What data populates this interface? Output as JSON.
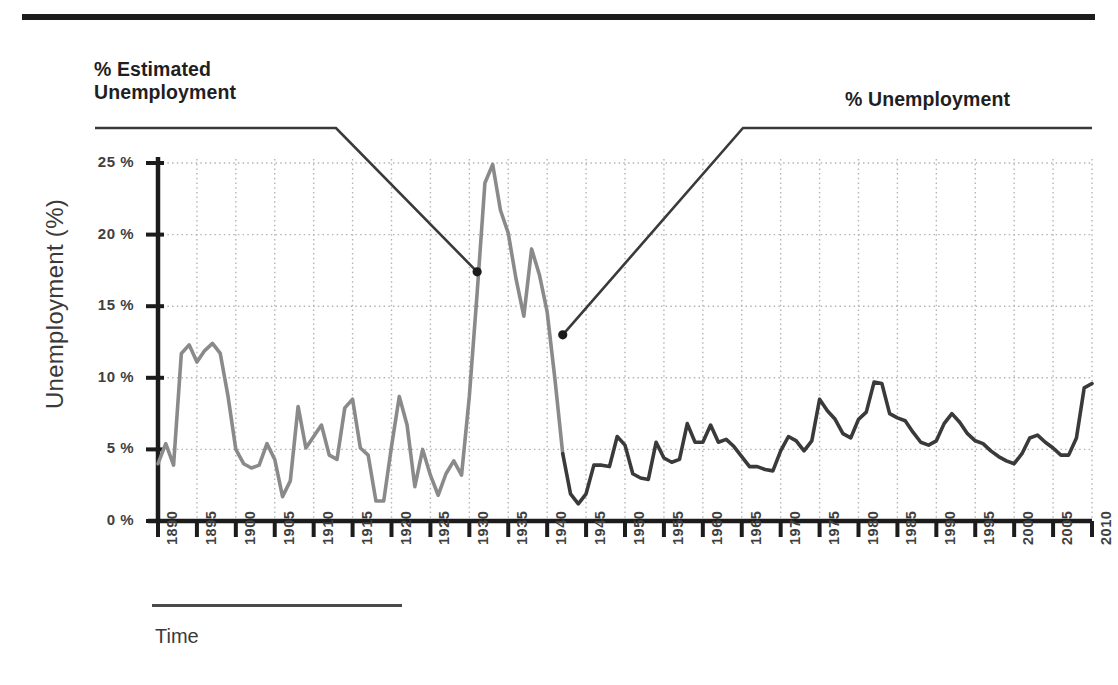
{
  "figure": {
    "top_rule": true,
    "callouts": [
      {
        "id": "estimated",
        "text": "% Estimated\nUnemployment",
        "color": "#1f1f1f"
      },
      {
        "id": "actual",
        "text": "% Unemployment",
        "color": "#1f1f1f"
      }
    ],
    "x_axis_caption": "Time"
  },
  "colors": {
    "estimated_series": "#8a8a8a",
    "actual_series": "#3a3a3a",
    "axis": "#1c1c1c",
    "grid": "#b4b4b4",
    "leader": "#3a3a3a",
    "rule": "#4a4a4a"
  },
  "chart_data": {
    "type": "line",
    "title": "",
    "subtitle": "",
    "xlabel": "Time",
    "ylabel": "Unemployment (%)",
    "xlim": [
      1890,
      2010
    ],
    "ylim": [
      0,
      25
    ],
    "grid": true,
    "legend_position": "callout-labels",
    "y_ticks": [
      0,
      5,
      10,
      15,
      20,
      25
    ],
    "y_tick_labels": [
      "0 %",
      "5 %",
      "10 %",
      "15 %",
      "20 %",
      "25 %"
    ],
    "x_ticks": [
      1890,
      1895,
      1900,
      1905,
      1910,
      1915,
      1920,
      1925,
      1930,
      1935,
      1940,
      1945,
      1950,
      1955,
      1960,
      1965,
      1970,
      1975,
      1980,
      1985,
      1990,
      1995,
      2000,
      2005,
      2010
    ],
    "x_tick_labels": [
      "1890",
      "1895",
      "1900",
      "1905",
      "1910",
      "1915",
      "1920",
      "1925",
      "1930",
      "1935",
      "1940",
      "1945",
      "1950",
      "1955",
      "1960",
      "1965",
      "1970",
      "1975",
      "1980",
      "1985",
      "1990",
      "1995",
      "2000",
      "2005",
      "2010"
    ],
    "annotations": [
      {
        "label": "% Estimated Unemployment",
        "points_to_year": 1931,
        "points_to_value": 17.4
      },
      {
        "label": "% Unemployment",
        "points_to_year": 1942,
        "points_to_value": 13.0
      }
    ],
    "series": [
      {
        "name": "% Estimated Unemployment",
        "color": "#8a8a8a",
        "x": [
          1890,
          1891,
          1892,
          1893,
          1894,
          1895,
          1896,
          1897,
          1898,
          1899,
          1900,
          1901,
          1902,
          1903,
          1904,
          1905,
          1906,
          1907,
          1908,
          1909,
          1910,
          1911,
          1912,
          1913,
          1914,
          1915,
          1916,
          1917,
          1918,
          1919,
          1920,
          1921,
          1922,
          1923,
          1924,
          1925,
          1926,
          1927,
          1928,
          1929,
          1930,
          1931,
          1932,
          1933,
          1934,
          1935,
          1936,
          1937,
          1938,
          1939,
          1940,
          1941,
          1942
        ],
        "values": [
          4.0,
          5.4,
          3.9,
          11.7,
          12.3,
          11.1,
          11.9,
          12.4,
          11.7,
          8.7,
          5.0,
          4.0,
          3.7,
          3.9,
          5.4,
          4.3,
          1.7,
          2.8,
          8.0,
          5.1,
          5.9,
          6.7,
          4.6,
          4.3,
          7.9,
          8.5,
          5.1,
          4.6,
          1.4,
          1.4,
          5.2,
          8.7,
          6.7,
          2.4,
          5.0,
          3.2,
          1.8,
          3.3,
          4.2,
          3.2,
          8.7,
          15.9,
          23.6,
          24.9,
          21.7,
          20.1,
          16.9,
          14.3,
          19.0,
          17.2,
          14.6,
          9.9,
          4.7
        ]
      },
      {
        "name": "% Unemployment",
        "color": "#3a3a3a",
        "x": [
          1942,
          1943,
          1944,
          1945,
          1946,
          1947,
          1948,
          1949,
          1950,
          1951,
          1952,
          1953,
          1954,
          1955,
          1956,
          1957,
          1958,
          1959,
          1960,
          1961,
          1962,
          1963,
          1964,
          1965,
          1966,
          1967,
          1968,
          1969,
          1970,
          1971,
          1972,
          1973,
          1974,
          1975,
          1976,
          1977,
          1978,
          1979,
          1980,
          1981,
          1982,
          1983,
          1984,
          1985,
          1986,
          1987,
          1988,
          1989,
          1990,
          1991,
          1992,
          1993,
          1994,
          1995,
          1996,
          1997,
          1998,
          1999,
          2000,
          2001,
          2002,
          2003,
          2004,
          2005,
          2006,
          2007,
          2008,
          2009,
          2010
        ],
        "values": [
          4.7,
          1.9,
          1.2,
          1.9,
          3.9,
          3.9,
          3.8,
          5.9,
          5.3,
          3.3,
          3.0,
          2.9,
          5.5,
          4.4,
          4.1,
          4.3,
          6.8,
          5.5,
          5.5,
          6.7,
          5.5,
          5.7,
          5.2,
          4.5,
          3.8,
          3.8,
          3.6,
          3.5,
          4.9,
          5.9,
          5.6,
          4.9,
          5.6,
          8.5,
          7.7,
          7.1,
          6.1,
          5.8,
          7.1,
          7.6,
          9.7,
          9.6,
          7.5,
          7.2,
          7.0,
          6.2,
          5.5,
          5.3,
          5.6,
          6.8,
          7.5,
          6.9,
          6.1,
          5.6,
          5.4,
          4.9,
          4.5,
          4.2,
          4.0,
          4.7,
          5.8,
          6.0,
          5.5,
          5.1,
          4.6,
          4.6,
          5.8,
          9.3,
          9.6
        ]
      }
    ]
  }
}
